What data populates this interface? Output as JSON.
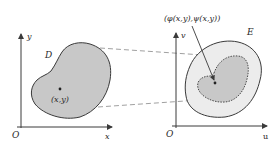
{
  "diagram": {
    "left_panel": {
      "axis_x_label": "x",
      "axis_y_label": "y",
      "origin_label": "O",
      "region_label": "D",
      "point_label": "(x,y)"
    },
    "right_panel": {
      "axis_x_label": "u",
      "axis_y_label": "v",
      "origin_label": "O",
      "region_label": "E",
      "point_label": "(φ(x,y),ψ(x,y))"
    },
    "colors": {
      "region_fill": "#c8c8c8",
      "outer_region_fill": "#ececec",
      "stroke": "#3a3a3a",
      "dashed": "#888888"
    }
  }
}
